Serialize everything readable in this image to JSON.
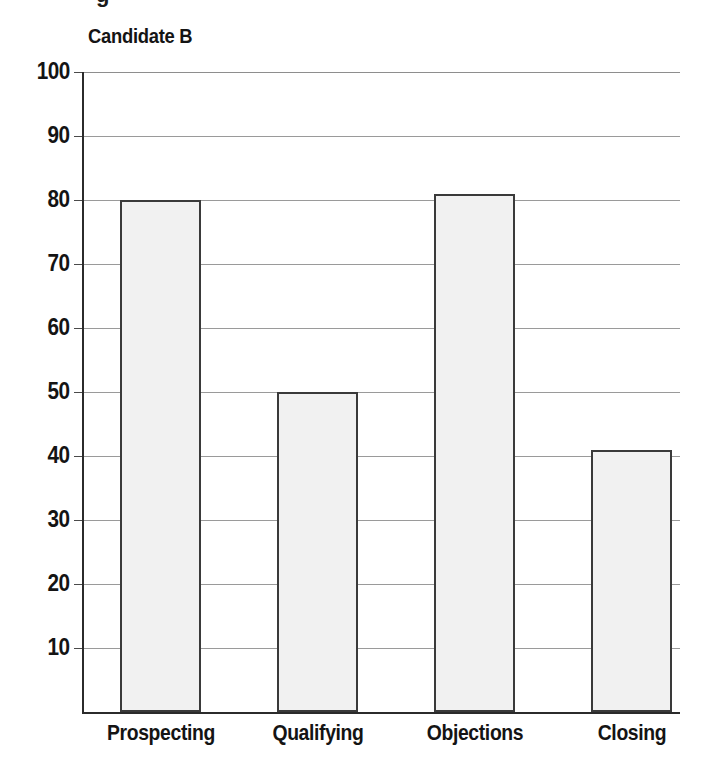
{
  "chart_data": {
    "type": "bar",
    "title": "Candidate B",
    "xlabel": "",
    "ylabel": "",
    "categories": [
      "Prospecting",
      "Qualifying",
      "Objections",
      "Closing"
    ],
    "values": [
      80,
      50,
      81,
      41
    ],
    "ylim": [
      0,
      100
    ],
    "yticks": [
      10,
      20,
      30,
      40,
      50,
      60,
      70,
      80,
      90,
      100
    ],
    "ytick_labels": [
      "10",
      "20",
      "30",
      "40",
      "50",
      "60",
      "70",
      "80",
      "90",
      "100"
    ],
    "grid": true,
    "grid_axis": "y",
    "legend": false,
    "legend_position": "none",
    "bar_fill_color": "#f1f1f1",
    "bar_border_color": "#3a3a3a",
    "gridline_color": "#9a9a9a",
    "axis_color": "#2b2b2b",
    "text_color": "#141414",
    "background_color": "#ffffff",
    "cropped_text_above": "g"
  }
}
